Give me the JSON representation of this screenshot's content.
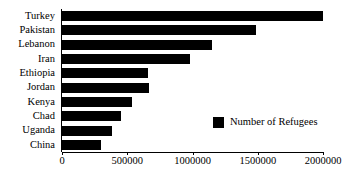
{
  "chart_data": {
    "type": "bar",
    "orientation": "horizontal",
    "title": "",
    "xlabel": "",
    "ylabel": "",
    "categories": [
      "Turkey",
      "Pakistan",
      "Lebanon",
      "Iran",
      "Ethiopia",
      "Jordan",
      "Kenya",
      "Chad",
      "Uganda",
      "China"
    ],
    "values": [
      2000000,
      1485000,
      1150000,
      980000,
      660000,
      665000,
      540000,
      450000,
      383000,
      296000
    ],
    "series": [
      {
        "name": "Number of Refugees",
        "color": "#000000",
        "values": [
          2000000,
          1485000,
          1150000,
          980000,
          660000,
          665000,
          540000,
          450000,
          383000,
          296000
        ]
      }
    ],
    "xlim": [
      0,
      2000000
    ],
    "xticks": [
      0,
      500000,
      1000000,
      1500000,
      2000000
    ],
    "xticklabels": [
      "0",
      "500000",
      "1000000",
      "1500000",
      "2000000"
    ],
    "grid": false,
    "legend": {
      "position": "inside-right",
      "entries": [
        {
          "label": "Number of Refugees",
          "color": "#000000",
          "marker": "square"
        }
      ]
    }
  },
  "colors": {
    "bar": "#000000",
    "axis": "#000000",
    "background": "#ffffff",
    "text": "#000000"
  }
}
